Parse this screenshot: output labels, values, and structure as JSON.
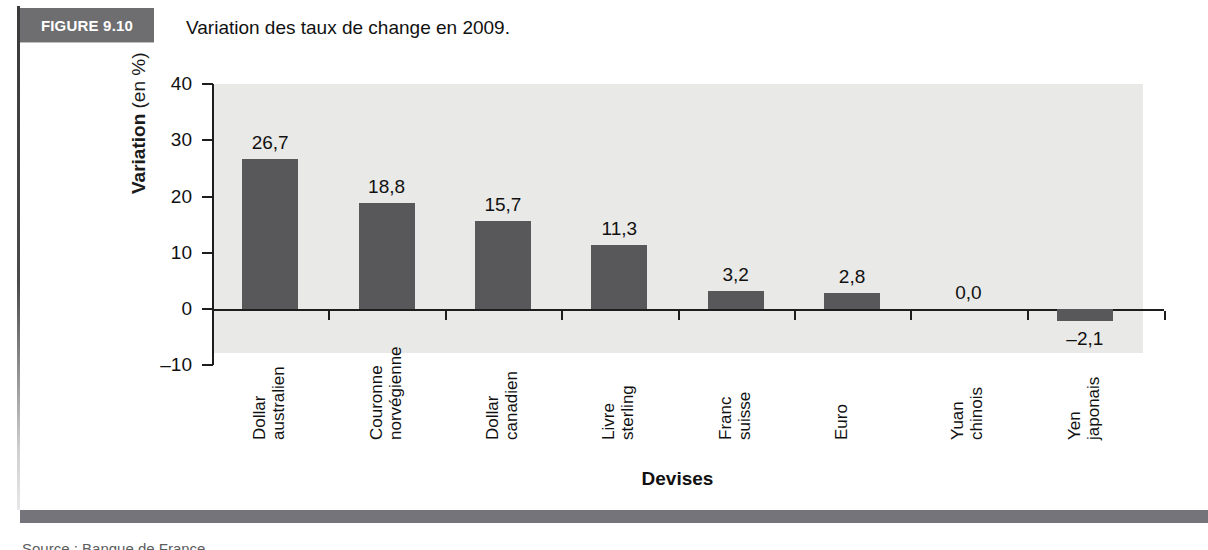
{
  "figure": {
    "badge": "FIGURE 9.10",
    "title": "Variation des taux de change en 2009."
  },
  "footer": {
    "caption_clipped": "Source : Banque de France"
  },
  "colors": {
    "bar": "#58585a",
    "plot_background": "#e9e9e7",
    "badge_background": "#6e6e70",
    "axis": "#1d1d1d",
    "footer_bar": "#74747a"
  },
  "chart_data": {
    "type": "bar",
    "title": "Variation des taux de change en 2009.",
    "xlabel": "Devises",
    "ylabel": "Variation (en %)",
    "ylabel_bold_part": "Variation",
    "ylabel_regular_part": "(en %)",
    "ylim": [
      -10,
      40
    ],
    "yticks": [
      40,
      30,
      20,
      10,
      0,
      -10
    ],
    "ytick_labels": [
      "40",
      "30",
      "20",
      "10",
      "0",
      "–10"
    ],
    "grid": false,
    "legend": false,
    "categories": [
      "Dollar australien",
      "Couronne norvégienne",
      "Dollar canadien",
      "Livre sterling",
      "Franc suisse",
      "Euro",
      "Yuan chinois",
      "Yen japonais"
    ],
    "category_lines": [
      [
        "Dollar",
        "australien"
      ],
      [
        "Couronne",
        "norvégienne"
      ],
      [
        "Dollar",
        "canadien"
      ],
      [
        "Livre",
        "sterling"
      ],
      [
        "Franc",
        "suisse"
      ],
      [
        "Euro",
        ""
      ],
      [
        "Yuan",
        "chinois"
      ],
      [
        "Yen",
        "japonais"
      ]
    ],
    "values": [
      26.7,
      18.8,
      15.7,
      11.3,
      3.2,
      2.8,
      0.0,
      -2.1
    ],
    "value_labels": [
      "26,7",
      "18,8",
      "15,7",
      "11,3",
      "3,2",
      "2,8",
      "0,0",
      "–2,1"
    ]
  }
}
